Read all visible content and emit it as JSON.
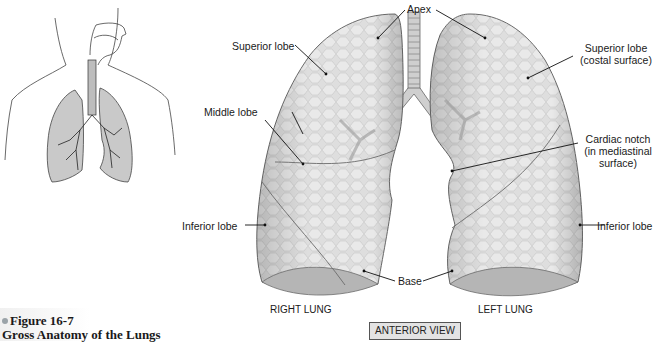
{
  "figure": {
    "number": "Figure 16-7",
    "title": "Gross Anatomy of the Lungs",
    "view": "ANTERIOR VIEW"
  },
  "lungs": {
    "right": "RIGHT LUNG",
    "left": "LEFT LUNG"
  },
  "labels": {
    "apex": "Apex",
    "right_superior_lobe": "Superior lobe",
    "right_middle_lobe": "Middle lobe",
    "right_inferior_lobe": "Inferior lobe",
    "base": "Base",
    "left_superior_lobe_line1": "Superior lobe",
    "left_superior_lobe_line2": "(costal surface)",
    "cardiac_notch_line1": "Cardiac notch",
    "cardiac_notch_line2": "(in mediastinal",
    "cardiac_notch_line3": "surface)",
    "left_inferior_lobe": "Inferior lobe"
  },
  "colors": {
    "lung_fill": "#d9d9d9",
    "lung_outline": "#6b6b6b",
    "bronchi": "#8a8a8a",
    "view_box": "#e3e3e3"
  }
}
